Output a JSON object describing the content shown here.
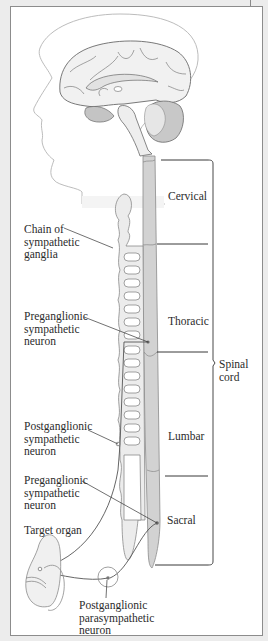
{
  "figure": {
    "colors": {
      "spinal_cord": "#d2d2d2",
      "ganglia_chain": "#ececec",
      "brain": "#f1f1f1",
      "brainstem_dark": "#b8b8b8",
      "lines": "#555555",
      "background": "#ececec",
      "frame": "#ffffff"
    }
  },
  "labels": {
    "cervical": "Cervical",
    "thoracic": "Thoracic",
    "lumbar": "Lumbar",
    "sacral": "Sacral",
    "spinal_cord": "Spinal\ncord",
    "chain": "Chain of\nsympathetic\nganglia",
    "pre_symp_1": "Preganglionic\nsympathetic\nneuron",
    "post_symp": "Postganglionic\nsympathetic\nneuron",
    "pre_symp_2": "Preganglionic\nsympathetic\nneuron",
    "target": "Target organ",
    "post_para": "Postganglionic\nparasympathetic\nneuron"
  }
}
